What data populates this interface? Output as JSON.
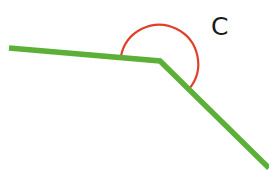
{
  "diagram": {
    "type": "angle",
    "angle_label": "C",
    "colors": {
      "line": "#5cb038",
      "arc": "#e0402a",
      "label": "#1a1a1a",
      "background": "#ffffff"
    },
    "vertex": [
      160,
      61
    ],
    "ray_left_end": [
      9,
      48
    ],
    "ray_right_end": [
      269,
      168
    ],
    "arc": {
      "start": [
        121,
        56
      ],
      "end": [
        189,
        89
      ],
      "radius": 39,
      "reflex": true
    }
  }
}
